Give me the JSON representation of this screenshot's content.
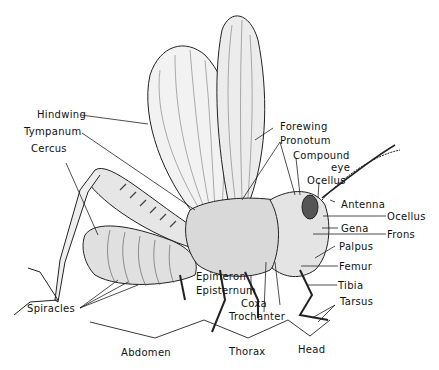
{
  "diagram": {
    "labels": {
      "hindwing": "Hindwing",
      "tympanum": "Tympanum",
      "cercus": "Cercus",
      "forewing": "Forewing",
      "pronotum": "Pronotum",
      "compound_eye_1": "Compound",
      "compound_eye_2": "eye",
      "ocellus_top": "Ocellus",
      "antenna": "Antenna",
      "ocellus_side": "Ocellus",
      "gena": "Gena",
      "frons": "Frons",
      "palpus": "Palpus",
      "femur": "Femur",
      "tibia": "Tibia",
      "tarsus": "Tarsus",
      "epimeron": "Epimeron",
      "episternum": "Episternum",
      "coxa": "Coxa",
      "trochanter": "Trochanter",
      "spiracles": "Spiracles",
      "abdomen": "Abdomen",
      "thorax": "Thorax",
      "head": "Head"
    }
  }
}
